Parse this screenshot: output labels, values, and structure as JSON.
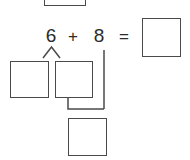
{
  "worksheet": {
    "title": "Make-a-ten number bond exercise",
    "equation": {
      "first_addend": "6",
      "plus_sign": "+",
      "second_addend": "8",
      "equals_sign": "=",
      "answer_value": ""
    },
    "boxes": {
      "top_partial_box_value": "",
      "bond_left_box_value": "",
      "bond_right_box_value": "",
      "sum_box_value": "",
      "answer_box_value": ""
    },
    "colors": {
      "ink": "#2b2b2b",
      "stroke": "#4a4a4a",
      "paper": "#ffffff"
    }
  }
}
